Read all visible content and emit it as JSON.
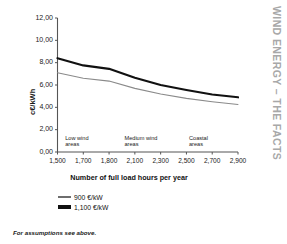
{
  "running_head": {
    "text": "WIND ENERGY – THE FACTS",
    "color": "#a8a8a8"
  },
  "footnote": {
    "text": "For assumptions see above."
  },
  "legend": {
    "items": [
      {
        "label": "900 €/kW",
        "style": "thin",
        "color": "#6e6e6e"
      },
      {
        "label": "1,100 €/kW",
        "style": "thick",
        "color": "#111111"
      }
    ]
  },
  "axes": {
    "y_title": "c€/kWh",
    "x_title": "Number of full load hours per year",
    "y_ticks": [
      "12,00",
      "10,00",
      "8,00",
      "6,00",
      "4,00",
      "2,00",
      "0,00"
    ],
    "x_ticks": [
      "1,500",
      "1,700",
      "1,800",
      "2,100",
      "2,300",
      "2,500",
      "2,700",
      "2,900"
    ]
  },
  "regions": [
    {
      "line1": "Low wind",
      "line2": "areas"
    },
    {
      "line1": "Medium wind",
      "line2": "areas"
    },
    {
      "line1": "Coastal",
      "line2": "areas"
    }
  ],
  "chart_data": {
    "type": "line",
    "title": "",
    "xlabel": "Number of full load hours per year",
    "ylabel": "c€/kWh",
    "ylim": [
      0,
      12
    ],
    "ytick_values": [
      12,
      10,
      8,
      6,
      4,
      2,
      0
    ],
    "ytick_labels": [
      "12,00",
      "10,00",
      "8,00",
      "6,00",
      "4,00",
      "2,00",
      "0,00"
    ],
    "x": [
      1500,
      1700,
      1800,
      2100,
      2300,
      2500,
      2700,
      2900
    ],
    "xtick_labels": [
      "1,500",
      "1,700",
      "1,800",
      "2,100",
      "2,300",
      "2,500",
      "2,700",
      "2,900"
    ],
    "grid": false,
    "legend_position": "below",
    "series": [
      {
        "name": "1,100 €/kW",
        "color": "#111111",
        "width": 2.2,
        "values": [
          8.4,
          7.75,
          7.45,
          6.65,
          6.0,
          5.55,
          5.15,
          4.9
        ]
      },
      {
        "name": "900 €/kW",
        "color": "#8a8a8a",
        "width": 1.1,
        "values": [
          7.1,
          6.6,
          6.35,
          5.7,
          5.2,
          4.8,
          4.5,
          4.25
        ]
      }
    ],
    "annotations": [
      {
        "text": "Low wind areas",
        "x": 1560,
        "y": 1.55
      },
      {
        "text": "Medium wind areas",
        "x": 2020,
        "y": 1.55
      },
      {
        "text": "Coastal areas",
        "x": 2520,
        "y": 1.55
      }
    ]
  }
}
